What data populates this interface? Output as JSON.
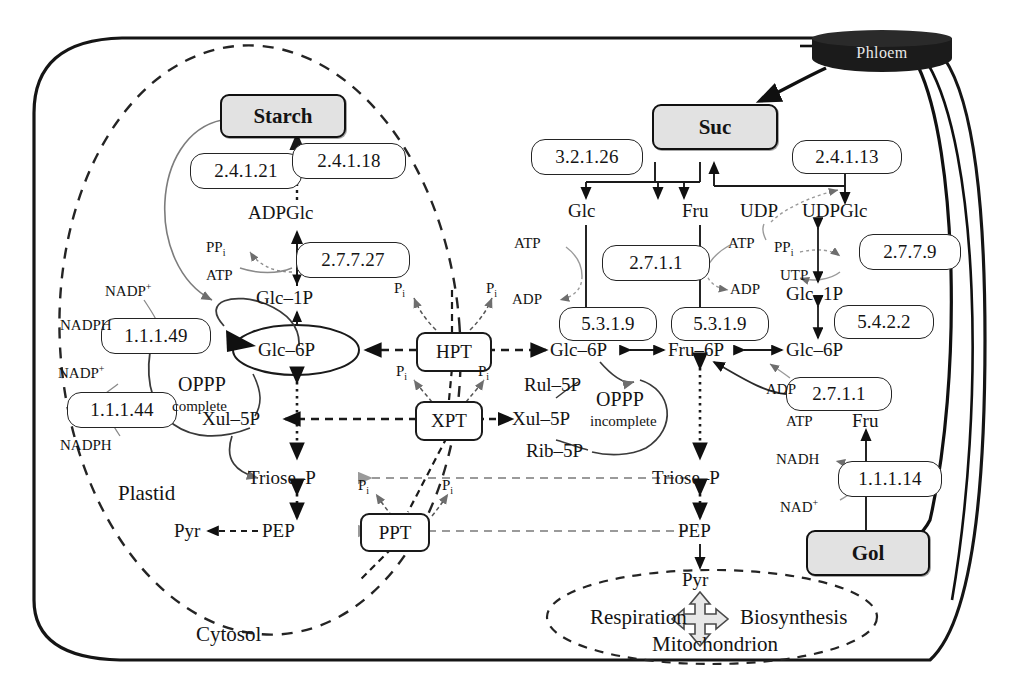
{
  "diagram": {
    "compartments": {
      "cell": "",
      "plastid": "Plastid",
      "cytosol": "Cytosol",
      "mitochondrion": "Mitochondrion",
      "phloem": "Phloem"
    },
    "pools": {
      "starch": "Starch",
      "suc": "Suc",
      "gol": "Gol"
    },
    "transporters": {
      "hpt": "HPT",
      "xpt": "XPT",
      "ppt": "PPT"
    },
    "enzymes": [
      {
        "id": "ec_2_4_1_21",
        "label": "2.4.1.21"
      },
      {
        "id": "ec_2_4_1_18",
        "label": "2.4.1.18"
      },
      {
        "id": "ec_2_7_7_27",
        "label": "2.7.7.27"
      },
      {
        "id": "ec_1_1_1_49",
        "label": "1.1.1.49"
      },
      {
        "id": "ec_1_1_1_44",
        "label": "1.1.1.44"
      },
      {
        "id": "ec_3_2_1_26",
        "label": "3.2.1.26"
      },
      {
        "id": "ec_2_4_1_13",
        "label": "2.4.1.13"
      },
      {
        "id": "ec_2_7_1_1_glc",
        "label": "2.7.1.1"
      },
      {
        "id": "ec_2_7_7_9",
        "label": "2.7.7.9"
      },
      {
        "id": "ec_5_3_1_9_a",
        "label": "5.3.1.9"
      },
      {
        "id": "ec_5_3_1_9_b",
        "label": "5.3.1.9"
      },
      {
        "id": "ec_5_4_2_2",
        "label": "5.4.2.2"
      },
      {
        "id": "ec_2_7_1_1_fru",
        "label": "2.7.1.1"
      },
      {
        "id": "ec_1_1_1_14",
        "label": "1.1.1.14"
      }
    ],
    "metabolites": {
      "adpglc": "ADPGlc",
      "glc1p_plastid": "Glc–1P",
      "glc6p_plastid": "Glc–6P",
      "xul5p_plastid": "Xul–5P",
      "triosep_plastid": "Triose–P",
      "pep_plastid": "PEP",
      "pyr_plastid": "Pyr",
      "glc": "Glc",
      "fru_top": "Fru",
      "udp": "UDP",
      "udpglc": "UDPGlc",
      "glc1p_cyt": "Glc–1P",
      "glc6p_cyt_left": "Glc–6P",
      "fru6p": "Fru–6P",
      "glc6p_cyt_right": "Glc–6P",
      "xul5p_cyt": "Xul–5P",
      "rul5p": "Rul–5P",
      "rib5p": "Rib–5P",
      "triosep_cyt": "Triose–P",
      "pep_cyt": "PEP",
      "pyr_cyt": "Pyr",
      "fru_gol": "Fru"
    },
    "cofactors": {
      "ppi_starch": "PP<sub>i</sub>",
      "atp_starch": "ATP",
      "nadp_plus_1": "NADP<sup>+</sup>",
      "nadph_1": "NADPH",
      "nadp_plus_2": "NADP<sup>+</sup>",
      "nadph_2": "NADPH",
      "atp_glc": "ATP",
      "adp_glc": "ADP",
      "atp_fru": "ATP",
      "adp_fru": "ADP",
      "ppi_udp": "PP<sub>i</sub>",
      "utp": "UTP",
      "atp_gol": "ATP",
      "adp_gol": "ADP",
      "nadh": "NADH",
      "nad_plus": "NAD<sup>+</sup>",
      "pi_hpt_left": "P<sub>i</sub>",
      "pi_hpt_right": "P<sub>i</sub>",
      "pi_xpt_left": "P<sub>i</sub>",
      "pi_xpt_right": "P<sub>i</sub>",
      "pi_ppt_left": "P<sub>i</sub>",
      "pi_ppt_right": "P<sub>i</sub>"
    },
    "annotations": {
      "oppp_complete_line1": "OPPP",
      "oppp_complete_line2": "complete",
      "oppp_incomplete_line1": "OPPP",
      "oppp_incomplete_line2": "incomplete",
      "respiration": "Respiration",
      "biosynthesis": "Biosynthesis"
    },
    "colors": {
      "ink": "#141414",
      "pool_fill": "#e2e2e2",
      "phloem_fill": "#1b1b1b",
      "faded_arrow": "#9a9a9a"
    }
  }
}
